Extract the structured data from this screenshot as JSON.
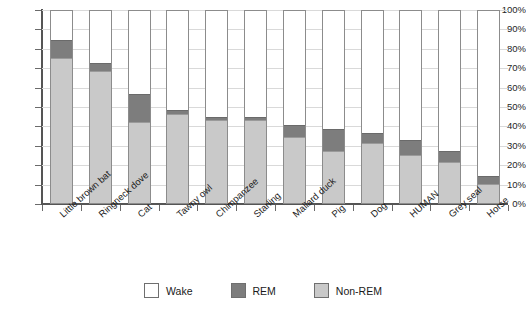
{
  "chart_data": {
    "type": "bar",
    "subtype": "stacked-percentage",
    "title": "",
    "xlabel": "",
    "ylabel": "",
    "ylim": [
      0,
      100
    ],
    "grid": true,
    "legend_position": "bottom",
    "categories": [
      "Little brown bat",
      "Ringneck dove",
      "Cat",
      "Tawny owl",
      "Chimpanzee",
      "Starling",
      "Mallard duck",
      "Pig",
      "Dog",
      "HUMAN",
      "Grey seal",
      "Horse"
    ],
    "series": [
      {
        "name": "Non-REM",
        "color": "#c9c9c9",
        "values": [
          75,
          68,
          42,
          46,
          43,
          43,
          34,
          27,
          31,
          25,
          21,
          10
        ]
      },
      {
        "name": "REM",
        "color": "#7d7d7d",
        "values": [
          9,
          4,
          14,
          2,
          1.5,
          1.5,
          6,
          11,
          5,
          7.5,
          6,
          4
        ]
      },
      {
        "name": "Wake",
        "color": "#ffffff",
        "values": [
          16,
          28,
          44,
          52,
          55.5,
          55.5,
          60,
          62,
          64,
          67.5,
          73,
          86
        ]
      }
    ],
    "y_ticks": [
      "0%",
      "10%",
      "20%",
      "30%",
      "40%",
      "50%",
      "60%",
      "70%",
      "80%",
      "90%",
      "100%"
    ],
    "y_tick_values": [
      0,
      10,
      20,
      30,
      40,
      50,
      60,
      70,
      80,
      90,
      100
    ]
  },
  "legend": {
    "items": [
      {
        "label": "Wake",
        "color": "#ffffff"
      },
      {
        "label": "REM",
        "color": "#7d7d7d"
      },
      {
        "label": "Non-REM",
        "color": "#c9c9c9"
      }
    ]
  },
  "colors": {
    "axis": "#555555",
    "grid": "#d9d9d9",
    "bar_border": "#8c8c8c",
    "text": "#1a1a1a",
    "background": "#ffffff"
  }
}
